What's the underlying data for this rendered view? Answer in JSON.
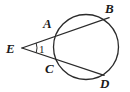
{
  "figure": {
    "background_color": "#ffffff",
    "stroke_color": "#2b2b2b",
    "label_color": "#1a1a1a",
    "width": 130,
    "height": 92
  },
  "labels": {
    "E": "E",
    "A": "A",
    "B": "B",
    "C": "C",
    "D": "D",
    "angle_1": "1"
  },
  "chart_data": {
    "type": "diagram",
    "subtype": "euclidean-geometry",
    "circle": {
      "center_x": 86,
      "center_y": 47,
      "radius": 32.5
    },
    "points": [
      {
        "name": "E",
        "x": 22,
        "y": 48,
        "on_circle": false,
        "role": "external-vertex"
      },
      {
        "name": "A",
        "x": 58,
        "y": 33,
        "on_circle": true,
        "role": "near-intersection-upper-secant"
      },
      {
        "name": "B",
        "x": 108,
        "y": 18,
        "on_circle": true,
        "role": "far-intersection-upper-secant"
      },
      {
        "name": "C",
        "x": 58,
        "y": 61,
        "on_circle": true,
        "role": "near-intersection-lower-secant"
      },
      {
        "name": "D",
        "x": 103,
        "y": 75,
        "on_circle": true,
        "role": "far-intersection-lower-secant"
      }
    ],
    "segments": [
      {
        "name": "EB",
        "from": "E",
        "to": "B",
        "through": "A",
        "kind": "secant"
      },
      {
        "name": "ED",
        "from": "E",
        "to": "D",
        "through": "C",
        "kind": "secant"
      }
    ],
    "angles": [
      {
        "name": "1",
        "vertex": "E",
        "rays": [
          "EB",
          "ED"
        ],
        "marked": true,
        "marker": "single-arc"
      }
    ]
  }
}
